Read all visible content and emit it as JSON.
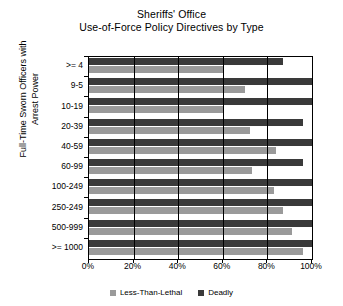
{
  "chart_data": {
    "type": "bar",
    "orientation": "horizontal",
    "title": "Sheriffs' Office Use-of-Force Policy Directives by Type",
    "title_lines": [
      "Sheriffs' Office",
      "Use-of-Force Policy Directives by Type"
    ],
    "xlabel": "",
    "ylabel": "Full-Time Sworn Officers with Arrest Power",
    "ylabel_lines": [
      "Full-Time Sworn Officers with",
      "Arrest Power"
    ],
    "categories": [
      ">= 4",
      "9-5",
      "10-19",
      "20-39",
      "40-59",
      "60-99",
      "100-249",
      "250-249",
      "500-999",
      ">= 1000"
    ],
    "series": [
      {
        "name": "Less-Than-Lethal",
        "color": "#9a9a9a",
        "values": [
          60,
          70,
          60,
          72,
          84,
          73,
          83,
          87,
          91,
          96
        ]
      },
      {
        "name": "Deadly",
        "color": "#3a3a3a",
        "values": [
          87,
          100,
          100,
          96,
          100,
          96,
          100,
          100,
          100,
          100
        ]
      }
    ],
    "xlim": [
      0,
      100
    ],
    "xticks": [
      0,
      20,
      40,
      60,
      80,
      100
    ],
    "xtick_labels": [
      "0%",
      "20%",
      "40%",
      "60%",
      "80%",
      "100%"
    ],
    "grid": true,
    "grid_axis": "x",
    "legend_position": "bottom",
    "legend": [
      {
        "label": "Less-Than-Lethal",
        "color": "#9a9a9a"
      },
      {
        "label": "Deadly",
        "color": "#3a3a3a"
      }
    ]
  }
}
